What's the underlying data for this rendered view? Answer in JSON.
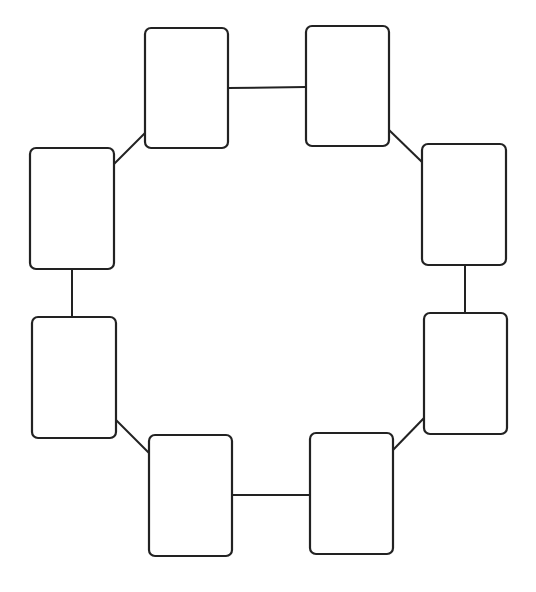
{
  "diagram": {
    "type": "cycle",
    "stroke_color": "#222222",
    "background": "#ffffff",
    "nodes": [
      {
        "id": "n1",
        "label": "",
        "x": 145,
        "y": 28,
        "w": 83,
        "h": 120
      },
      {
        "id": "n2",
        "label": "",
        "x": 306,
        "y": 26,
        "w": 83,
        "h": 120
      },
      {
        "id": "n3",
        "label": "",
        "x": 422,
        "y": 144,
        "w": 84,
        "h": 121
      },
      {
        "id": "n4",
        "label": "",
        "x": 424,
        "y": 313,
        "w": 83,
        "h": 121
      },
      {
        "id": "n5",
        "label": "",
        "x": 310,
        "y": 433,
        "w": 83,
        "h": 121
      },
      {
        "id": "n6",
        "label": "",
        "x": 149,
        "y": 435,
        "w": 83,
        "h": 121
      },
      {
        "id": "n7",
        "label": "",
        "x": 32,
        "y": 317,
        "w": 84,
        "h": 121
      },
      {
        "id": "n8",
        "label": "",
        "x": 30,
        "y": 148,
        "w": 84,
        "h": 121
      }
    ],
    "edges": [
      {
        "from": "n1",
        "to": "n2",
        "x1": 228,
        "y1": 88,
        "x2": 306,
        "y2": 87
      },
      {
        "from": "n2",
        "to": "n3",
        "x1": 389,
        "y1": 130,
        "x2": 422,
        "y2": 162
      },
      {
        "from": "n3",
        "to": "n4",
        "x1": 465,
        "y1": 265,
        "x2": 465,
        "y2": 313
      },
      {
        "from": "n4",
        "to": "n5",
        "x1": 424,
        "y1": 418,
        "x2": 393,
        "y2": 450
      },
      {
        "from": "n5",
        "to": "n6",
        "x1": 310,
        "y1": 495,
        "x2": 232,
        "y2": 495
      },
      {
        "from": "n6",
        "to": "n7",
        "x1": 149,
        "y1": 453,
        "x2": 116,
        "y2": 420
      },
      {
        "from": "n7",
        "to": "n8",
        "x1": 72,
        "y1": 317,
        "x2": 72,
        "y2": 269
      },
      {
        "from": "n8",
        "to": "n1",
        "x1": 114,
        "y1": 164,
        "x2": 145,
        "y2": 133
      }
    ]
  }
}
